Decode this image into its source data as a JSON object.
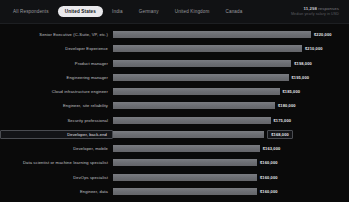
{
  "header": {
    "tabs": [
      {
        "label": "All Respondents",
        "active": false
      },
      {
        "label": "United States",
        "active": true
      },
      {
        "label": "India",
        "active": false
      },
      {
        "label": "Germany",
        "active": false
      },
      {
        "label": "United Kingdom",
        "active": false
      },
      {
        "label": "Canada",
        "active": false
      }
    ],
    "stats_main_value": "11,298",
    "stats_main_suffix": "responses",
    "stats_sub": "Median yearly salary in USD"
  },
  "colors": {
    "background": "#0a0a0a",
    "header_background": "#111214",
    "bar": "#6f7176",
    "active_tab_background": "#e9e9ec",
    "label_text": "#c2c3c7",
    "value_text": "#e6e7ea",
    "highlight_border": "#4a4c51"
  },
  "chart_data": {
    "type": "bar",
    "orientation": "horizontal",
    "title": "",
    "xlabel": "",
    "ylabel": "",
    "xlim": [
      0,
      220000
    ],
    "grid": false,
    "legend": "none",
    "value_prefix": "$",
    "categories": [
      "Senior Executive (C-Suite, VP, etc.)",
      "Developer Experience",
      "Product manager",
      "Engineering manager",
      "Cloud infrastructure engineer",
      "Engineer, site reliability",
      "Security professional",
      "Developer, back-end",
      "Developer, mobile",
      "Data scientist or machine learning specialist",
      "DevOps specialist",
      "Engineer, data"
    ],
    "values": [
      220000,
      210000,
      198000,
      195000,
      185000,
      180000,
      175000,
      168000,
      163000,
      160000,
      160000,
      160000
    ],
    "value_labels": [
      "$220,000",
      "$210,000",
      "$198,000",
      "$195,000",
      "$185,000",
      "$180,000",
      "$175,000",
      "$168,000",
      "$163,000",
      "$160,000",
      "$160,000",
      "$160,000"
    ],
    "highlighted_index": 7
  }
}
